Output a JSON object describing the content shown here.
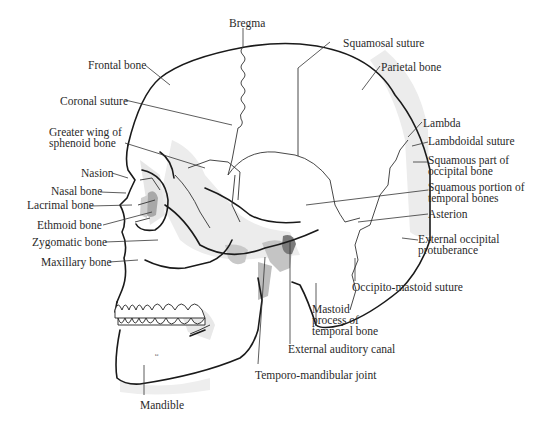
{
  "diagram": {
    "colors": {
      "outline": "#1a1a1a",
      "suture": "#333333",
      "leader": "#333333",
      "shade_light": "#ececec",
      "shade_mid": "#d6d6d6",
      "shade_dark": "#9a9a9a",
      "background": "#ffffff"
    }
  },
  "labels": {
    "bregma": "Bregma",
    "squamosal_suture": "Squamosal suture",
    "frontal_bone": "Frontal bone",
    "parietal_bone": "Parietal bone",
    "coronal_suture": "Coronal suture",
    "lambda": "Lambda",
    "lambdoidal_suture": "Lambdoidal suture",
    "greater_wing": [
      "Greater wing of",
      "sphenoid bone"
    ],
    "squamous_occipital": [
      "Squamous part of",
      "occipital bone"
    ],
    "nasion": "Nasion",
    "squamous_temporal": [
      "Squamous portion of",
      "temporal bones"
    ],
    "nasal_bone": "Nasal bone",
    "lacrimal_bone": "Lacrimal bone",
    "asterion": "Asterion",
    "ethmoid_bone": "Ethmoid bone",
    "zygomatic_bone": "Zygomatic bone",
    "external_occipital": [
      "External occipital",
      "protuberance"
    ],
    "maxillary_bone": "Maxillary bone",
    "occipito_mastoid": "Occipito-mastoid suture",
    "mastoid_process": [
      "Mastoid",
      "process of",
      "temporal bone"
    ],
    "external_auditory": "External auditory canal",
    "tmj": "Temporo-mandibular joint",
    "mandible": "Mandible"
  }
}
